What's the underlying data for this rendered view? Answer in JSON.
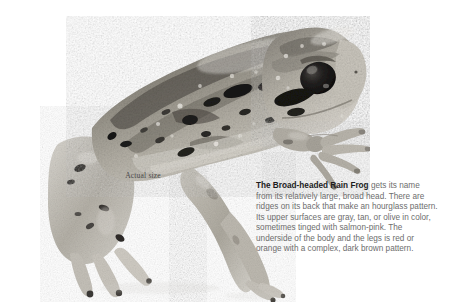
{
  "page": {
    "background_color": "#ffffff"
  },
  "photo": {
    "subject": "broad-headed-rain-frog",
    "alt": "Grayscale photograph of a Broad-headed Rain Frog in profile facing right",
    "palette": {
      "skin_light": "#d9d6cf",
      "skin_mid": "#a9a49a",
      "skin_dark": "#6e6a62",
      "blotch": "#1d1c1a",
      "eye": "#141312",
      "highlight": "#f2f0ec"
    }
  },
  "caption": {
    "actual_size": "Actual size"
  },
  "description": {
    "lead": "The Broad-headed Rain Frog",
    "body": " gets its name from its relatively large, broad head. There are ridges on its back that make an hourglass pattern. Its upper surfaces are gray, tan, or olive in color, sometimes tinged with salmon-pink. The underside of the body and the legs is red or orange with a complex, dark brown pattern.",
    "text_color": "#6d6d6d",
    "lead_color": "#1c1c1c"
  }
}
